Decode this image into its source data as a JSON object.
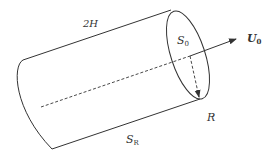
{
  "diagram": {
    "labels": {
      "length": "2H",
      "end_face": {
        "base": "S",
        "sub": "0"
      },
      "velocity": {
        "base": "U",
        "sub": "0"
      },
      "radius": "R",
      "lateral_surface": {
        "base": "S",
        "sub": "R"
      }
    },
    "colors": {
      "stroke": "#333333",
      "text": "#333333"
    }
  }
}
